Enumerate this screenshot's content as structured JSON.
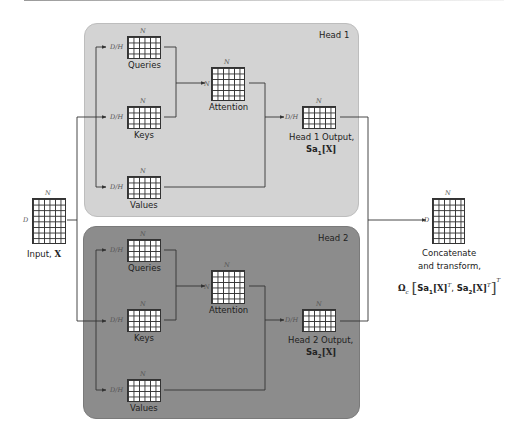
{
  "figure": {
    "type": "multi-head self-attention diagram",
    "colors": {
      "head1_bg": "#d3d3d3",
      "head2_bg": "#8c8c8c",
      "line": "#333333",
      "grid_fill": "#ffffff"
    }
  },
  "input": {
    "label": "Input, ",
    "symbol": "X",
    "rows_dim": "D",
    "cols_dim": "N",
    "grid": {
      "cols": 6,
      "rows": 8
    }
  },
  "heads": [
    {
      "title": "Head 1",
      "queries": {
        "label": "Queries",
        "rows_dim": "D/H",
        "cols_dim": "N",
        "grid": {
          "cols": 6,
          "rows": 4
        }
      },
      "keys": {
        "label": "Keys",
        "rows_dim": "D/H",
        "cols_dim": "N",
        "grid": {
          "cols": 6,
          "rows": 4
        }
      },
      "values": {
        "label": "Values",
        "rows_dim": "D/H",
        "cols_dim": "N",
        "grid": {
          "cols": 6,
          "rows": 4
        }
      },
      "attention": {
        "label": "Attention",
        "rows_dim": "N",
        "cols_dim": "N",
        "grid": {
          "cols": 6,
          "rows": 6
        }
      },
      "output": {
        "label": "Head 1 Output,",
        "formula_prefix": "Sa",
        "formula_sub": "1",
        "formula_arg": "[X]",
        "rows_dim": "D/H",
        "cols_dim": "N",
        "grid": {
          "cols": 6,
          "rows": 4
        }
      }
    },
    {
      "title": "Head 2",
      "queries": {
        "label": "Queries",
        "rows_dim": "D/H",
        "cols_dim": "N",
        "grid": {
          "cols": 6,
          "rows": 4
        }
      },
      "keys": {
        "label": "Keys",
        "rows_dim": "D/H",
        "cols_dim": "N",
        "grid": {
          "cols": 6,
          "rows": 4
        }
      },
      "values": {
        "label": "Values",
        "rows_dim": "D/H",
        "cols_dim": "N",
        "grid": {
          "cols": 6,
          "rows": 4
        }
      },
      "attention": {
        "label": "Attention",
        "rows_dim": "N",
        "cols_dim": "N",
        "grid": {
          "cols": 6,
          "rows": 6
        }
      },
      "output": {
        "label": "Head 2 Output,",
        "formula_prefix": "Sa",
        "formula_sub": "2",
        "formula_arg": "[X]",
        "rows_dim": "D/H",
        "cols_dim": "N",
        "grid": {
          "cols": 6,
          "rows": 4
        }
      }
    }
  ],
  "output": {
    "label_line1": "Concatenate",
    "label_line2": "and transform,",
    "rows_dim": "D",
    "cols_dim": "N",
    "grid": {
      "cols": 6,
      "rows": 8
    },
    "formula": {
      "omega": "Ω",
      "omega_sub": "c",
      "open": "[",
      "t1_prefix": "Sa",
      "t1_sub": "1",
      "t1_arg": "[X]",
      "t1_sup": "T",
      "comma": ", ",
      "t2_prefix": "Sa",
      "t2_sub": "2",
      "t2_arg": "[X]",
      "t2_sup": "T",
      "close": "]",
      "outer_sup": "T"
    }
  }
}
